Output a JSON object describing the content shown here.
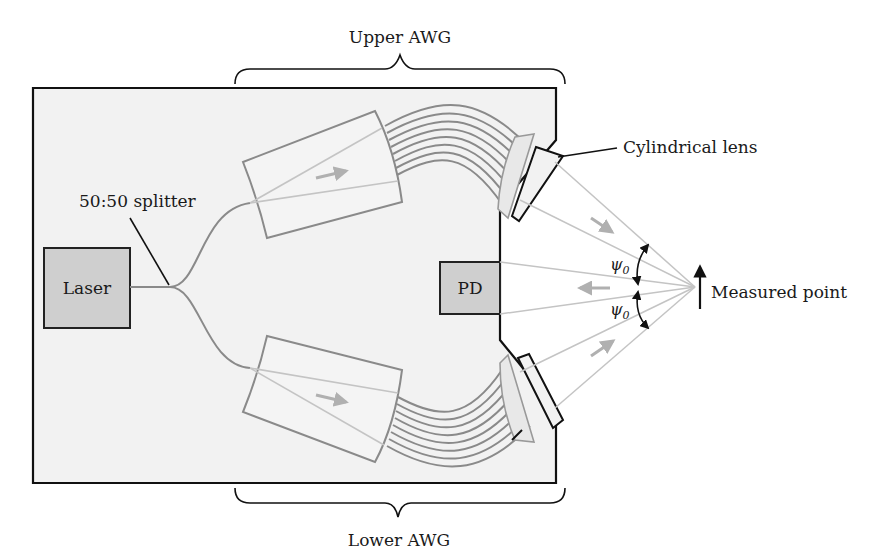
{
  "figure": {
    "type": "optical system schematic",
    "colors": {
      "chip_fill": "#f2f2f2",
      "chip_border": "#111111",
      "component_fill": "#cfcfcf",
      "waveguide": "#8a8a8a",
      "beam": "#c4c4c4",
      "arrow": "#b0b0b0",
      "text": "#1a1a1a"
    }
  },
  "labels": {
    "upper_awg": "Upper AWG",
    "lower_awg": "Lower AWG",
    "splitter": "50:50 splitter",
    "laser": "Laser",
    "pd": "PD",
    "cylindrical_lens": "Cylindrical lens",
    "measured_point": "Measured point",
    "psi_upper": "ψ",
    "psi_upper_sub": "0",
    "psi_lower": "ψ",
    "psi_lower_sub": "0"
  }
}
